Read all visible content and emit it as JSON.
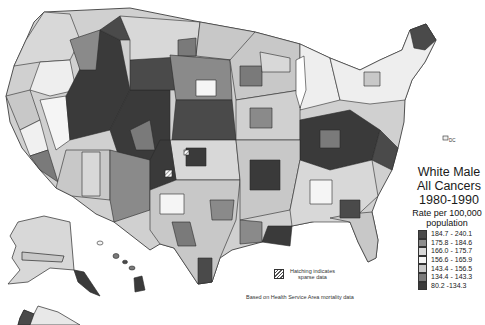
{
  "title": {
    "line1": "White Male",
    "line2": "All Cancers",
    "line3": "1980-1990"
  },
  "legend": {
    "caption_line1": "Rate per 100,000",
    "caption_line2": "population",
    "items": [
      {
        "label": "184.7 - 240.1",
        "color": "#4a4a4a"
      },
      {
        "label": "175.8 - 184.6",
        "color": "#8c8c8c"
      },
      {
        "label": "166.0 - 175.7",
        "color": "#d9d9d9"
      },
      {
        "label": "156.6 - 165.9",
        "color": "#f5f5f5"
      },
      {
        "label": "143.4 - 156.5",
        "color": "#c8c8c8"
      },
      {
        "label": "134.4 - 143.3",
        "color": "#7a7a7a"
      },
      {
        "label": "80.2 -134.3",
        "color": "#3a3a3a"
      }
    ]
  },
  "hatching_note": {
    "line1": "Hatching indicates",
    "line2": "sparse data"
  },
  "source_note": "Based on Health Service Area mortality data",
  "dc_label": "DC",
  "colors": {
    "background": "#ffffff",
    "border": "#2a2a2a"
  }
}
